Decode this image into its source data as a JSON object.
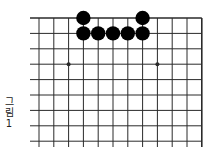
{
  "caption": {
    "lines": [
      "그",
      "림",
      "1"
    ],
    "text": "그림 1"
  },
  "board": {
    "columns": 12,
    "rows": 9,
    "origin_x": 39,
    "origin_y": 18,
    "spacing_x": 14.8,
    "spacing_y": 15.4,
    "line_left_extend": 30,
    "line_bottom_extend": 147,
    "right_edge": true,
    "top_edge": true,
    "line_color": "#2a2a2a",
    "stone_color": "#000000",
    "star_points": [
      {
        "col": 2,
        "row": 3
      },
      {
        "col": 8,
        "row": 3
      }
    ],
    "black_stones": [
      {
        "col": 3,
        "row": 0
      },
      {
        "col": 7,
        "row": 0
      },
      {
        "col": 3,
        "row": 1
      },
      {
        "col": 4,
        "row": 1
      },
      {
        "col": 5,
        "row": 1
      },
      {
        "col": 6,
        "row": 1
      },
      {
        "col": 7,
        "row": 1
      }
    ]
  }
}
